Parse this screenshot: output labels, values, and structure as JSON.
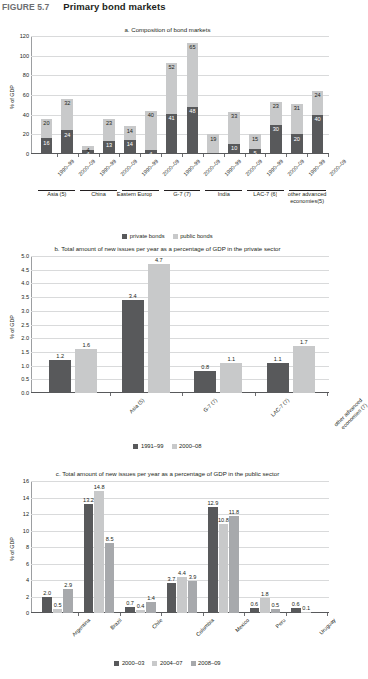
{
  "figure": {
    "number": "FIGURE 5.7",
    "title": "Primary bond markets"
  },
  "chart_data": [
    {
      "id": "a",
      "type": "bar",
      "stacked": true,
      "title": "a. Composition of bond markets",
      "xlabel": "",
      "ylabel": "% of GDP",
      "ylim": [
        0,
        120
      ],
      "yticks": [
        0,
        20,
        40,
        60,
        80,
        100,
        120
      ],
      "grid": true,
      "legend_position": "bottom",
      "categories": [
        "1990–99",
        "2000–09",
        "1990–99",
        "2000–09",
        "1990–99",
        "2000–09",
        "1990–99",
        "2000–09",
        "1990–99",
        "2000–09",
        "1990–99",
        "2000–09",
        "1990–99",
        "2000–09"
      ],
      "groups": [
        {
          "label": "Asia (5)",
          "span": 2
        },
        {
          "label": "China",
          "span": 2
        },
        {
          "label": "Eastern Europe (2)",
          "span": 2
        },
        {
          "label": "G-7 (7)",
          "span": 2
        },
        {
          "label": "India",
          "span": 2
        },
        {
          "label": "LAC-7 (6)",
          "span": 2
        },
        {
          "label": "other advanced economies(5)",
          "span": 2
        }
      ],
      "series": [
        {
          "name": "private bonds",
          "color": "#58595b",
          "values": [
            16,
            24,
            4,
            13,
            14,
            4,
            41,
            48,
            1,
            10,
            5,
            30,
            20,
            40
          ]
        },
        {
          "name": "public bonds",
          "color": "#c8c9ca",
          "values": [
            20,
            32,
            4,
            23,
            14,
            40,
            52,
            65,
            19,
            33,
            15,
            23,
            31,
            24
          ]
        }
      ],
      "bar_labels": {
        "private": [
          "16",
          "24",
          "4",
          "13",
          "14",
          "4",
          "41",
          "48",
          "",
          "10",
          "5",
          "30",
          "20",
          "40"
        ],
        "public": [
          "20",
          "32",
          "4",
          "23",
          "14",
          "40",
          "52",
          "65",
          "19",
          "33",
          "15",
          "23",
          "31",
          "24"
        ]
      }
    },
    {
      "id": "b",
      "type": "bar",
      "stacked": false,
      "title": "b. Total amount of new issues per year as a percentage of GDP in the private sector",
      "xlabel": "",
      "ylabel": "% of GDP",
      "ylim": [
        0,
        5.0
      ],
      "yticks": [
        "0.0",
        "0.5",
        "1.0",
        "1.5",
        "2.0",
        "2.5",
        "3.0",
        "3.5",
        "4.0",
        "4.5",
        "5.0"
      ],
      "grid": true,
      "legend_position": "bottom",
      "categories": [
        "Asia (5)",
        "G-7 (7)",
        "LAC-7 (7)",
        "other advanced economies (7)"
      ],
      "series": [
        {
          "name": "1991–99",
          "color": "#58595b",
          "values": [
            1.2,
            3.4,
            0.8,
            1.1
          ]
        },
        {
          "name": "2000–08",
          "color": "#c8c9ca",
          "values": [
            1.6,
            4.7,
            1.1,
            1.7
          ]
        }
      ],
      "bar_labels": {
        "s1": [
          "1.2",
          "3.4",
          "0.8",
          "1.1"
        ],
        "s2": [
          "1.6",
          "4.7",
          "1.1",
          "1.7"
        ]
      }
    },
    {
      "id": "c",
      "type": "bar",
      "stacked": false,
      "title": "c. Total amount of new issues per year as a percentage of GDP in the public sector",
      "xlabel": "",
      "ylabel": "% of GDP",
      "ylim": [
        0,
        16
      ],
      "yticks": [
        "0",
        "2",
        "4",
        "6",
        "8",
        "10",
        "12",
        "14",
        "16"
      ],
      "grid": true,
      "legend_position": "bottom",
      "categories": [
        "Argentina",
        "Brazil",
        "Chile",
        "Colombia",
        "Mexico",
        "Peru",
        "Uruguay"
      ],
      "series": [
        {
          "name": "2000–03",
          "color": "#58595b",
          "values": [
            2.0,
            13.2,
            0.7,
            3.7,
            12.9,
            0.6,
            0.6
          ]
        },
        {
          "name": "2004–07",
          "color": "#c8c9ca",
          "values": [
            0.5,
            14.8,
            0.4,
            4.4,
            10.8,
            1.8,
            0.1
          ]
        },
        {
          "name": "2008–09",
          "color": "#a7a9ac",
          "values": [
            2.9,
            8.5,
            1.4,
            3.9,
            11.8,
            0.5,
            0.0
          ]
        }
      ],
      "bar_labels": {
        "s1": [
          "2.0",
          "13.2",
          "0.7",
          "3.7",
          "12.9",
          "0.6",
          "0.6"
        ],
        "s2": [
          "0.5",
          "14.8",
          "0.4",
          "4.4",
          "10.8",
          "1.8",
          "0.1"
        ],
        "s3": [
          "2.9",
          "8.5",
          "1.4",
          "3.9",
          "11.8",
          "0.5",
          ""
        ]
      }
    }
  ]
}
